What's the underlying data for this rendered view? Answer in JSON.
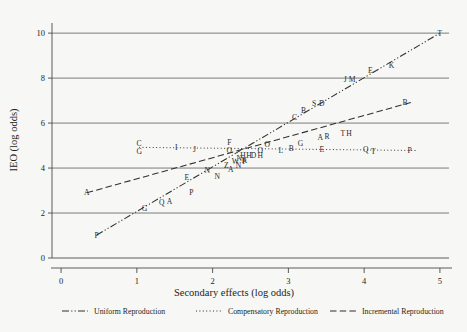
{
  "chart_data": {
    "type": "scatter",
    "title": "",
    "xlabel": "Secondary effects (log odds)",
    "ylabel": "IEO (log odds)",
    "xlim": [
      -0.12,
      5.12
    ],
    "ylim": [
      0,
      10.45
    ],
    "xticks": [
      0,
      1,
      2,
      3,
      4,
      5
    ],
    "yticks": [
      0,
      2,
      4,
      6,
      8,
      10
    ],
    "xtick_labels": [
      "0",
      "1",
      "2",
      "3",
      "4",
      "5"
    ],
    "ytick_labels": [
      "0",
      "2",
      "4",
      "6",
      "8",
      "10"
    ],
    "grid": "horizontal",
    "legend_position": "bottom",
    "legend": [
      {
        "name": "Uniform Reproduction",
        "style": "dash-dot-dot"
      },
      {
        "name": "Compensatory Reproduction",
        "style": "dotted"
      },
      {
        "name": "Incremental Reproduction",
        "style": "dashed"
      }
    ],
    "series": [
      {
        "name": "Uniform Reproduction",
        "style": "dash-dot-dot",
        "line": {
          "x0": 0.47,
          "y0": 1.02,
          "x1": 5.0,
          "y1": 10.0
        },
        "points": [
          {
            "label": "P",
            "x": 0.47,
            "y": 1.02
          },
          {
            "label": "G",
            "x": 1.1,
            "y": 2.22
          },
          {
            "label": "Q",
            "x": 1.33,
            "y": 2.48
          },
          {
            "label": "A",
            "x": 1.43,
            "y": 2.5
          },
          {
            "label": "P",
            "x": 1.72,
            "y": 2.92
          },
          {
            "label": "N",
            "x": 2.06,
            "y": 3.64
          },
          {
            "label": "A",
            "x": 2.24,
            "y": 3.95
          },
          {
            "label": "N",
            "x": 2.34,
            "y": 4.12
          },
          {
            "label": "K",
            "x": 2.42,
            "y": 4.35
          },
          {
            "label": "H",
            "x": 2.48,
            "y": 4.55
          },
          {
            "label": "O",
            "x": 2.63,
            "y": 4.8
          },
          {
            "label": "O",
            "x": 2.72,
            "y": 5.05
          },
          {
            "label": "C",
            "x": 3.08,
            "y": 6.25
          },
          {
            "label": "B",
            "x": 3.2,
            "y": 6.55
          },
          {
            "label": "S",
            "x": 3.34,
            "y": 6.86
          },
          {
            "label": "D",
            "x": 3.44,
            "y": 6.88
          },
          {
            "label": "J",
            "x": 3.75,
            "y": 7.96
          },
          {
            "label": "M",
            "x": 3.84,
            "y": 7.96
          },
          {
            "label": "E",
            "x": 4.08,
            "y": 8.32
          },
          {
            "label": "K",
            "x": 4.36,
            "y": 8.58
          },
          {
            "label": "T",
            "x": 5.0,
            "y": 10.0
          }
        ]
      },
      {
        "name": "Compensatory Reproduction",
        "style": "dotted",
        "line": {
          "x0": 1.03,
          "y0": 4.92,
          "x1": 4.68,
          "y1": 4.78
        },
        "points": [
          {
            "label": "C",
            "x": 1.03,
            "y": 5.1
          },
          {
            "label": "G",
            "x": 1.03,
            "y": 4.72
          },
          {
            "label": "I",
            "x": 1.52,
            "y": 4.9
          },
          {
            "label": "J",
            "x": 1.76,
            "y": 4.82
          },
          {
            "label": "F",
            "x": 2.22,
            "y": 5.12
          },
          {
            "label": "O",
            "x": 2.22,
            "y": 4.8
          },
          {
            "label": "L",
            "x": 2.9,
            "y": 4.8
          },
          {
            "label": "B",
            "x": 3.04,
            "y": 4.88
          },
          {
            "label": "E",
            "x": 3.44,
            "y": 4.85
          },
          {
            "label": "Q",
            "x": 4.02,
            "y": 4.84
          },
          {
            "label": "T",
            "x": 4.12,
            "y": 4.74
          },
          {
            "label": "P",
            "x": 4.6,
            "y": 4.8
          }
        ]
      },
      {
        "name": "Incremental Reproduction",
        "style": "dashed",
        "line": {
          "x0": 0.34,
          "y0": 2.9,
          "x1": 4.62,
          "y1": 6.92
        },
        "points": [
          {
            "label": "A",
            "x": 0.34,
            "y": 2.9
          },
          {
            "label": "E",
            "x": 1.66,
            "y": 3.6
          },
          {
            "label": "N",
            "x": 1.93,
            "y": 3.9
          },
          {
            "label": "Z",
            "x": 2.18,
            "y": 4.12
          },
          {
            "label": "W",
            "x": 2.3,
            "y": 4.3
          },
          {
            "label": "N",
            "x": 2.35,
            "y": 4.42
          },
          {
            "label": "H",
            "x": 2.4,
            "y": 4.58
          },
          {
            "label": "P",
            "x": 2.42,
            "y": 4.28
          },
          {
            "label": "D",
            "x": 2.54,
            "y": 4.55
          },
          {
            "label": "H",
            "x": 2.63,
            "y": 4.55
          },
          {
            "label": "G",
            "x": 3.16,
            "y": 5.1
          },
          {
            "label": "A",
            "x": 3.42,
            "y": 5.38
          },
          {
            "label": "R",
            "x": 3.51,
            "y": 5.4
          },
          {
            "label": "T",
            "x": 3.72,
            "y": 5.56
          },
          {
            "label": "H",
            "x": 3.8,
            "y": 5.54
          },
          {
            "label": "B",
            "x": 4.54,
            "y": 6.92
          }
        ]
      }
    ]
  }
}
